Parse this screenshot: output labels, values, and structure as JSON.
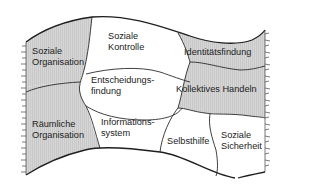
{
  "diagram": {
    "type": "banner-area-diagram",
    "colors": {
      "shaded_fill": "#d2d2d2",
      "white_fill": "#ffffff",
      "stroke": "#2a2a2a",
      "text": "#222222"
    },
    "regions": [
      {
        "id": "soziale-organisation",
        "lines": [
          "Soziale",
          "Organisation"
        ],
        "shaded": true
      },
      {
        "id": "raeumliche-organisation",
        "lines": [
          "Räumliche",
          "Organisation"
        ],
        "shaded": true
      },
      {
        "id": "soziale-kontrolle",
        "lines": [
          "Soziale",
          "Kontrolle"
        ],
        "shaded": false
      },
      {
        "id": "entscheidungsfindung",
        "lines": [
          "Entscheidungs-",
          "findung"
        ],
        "shaded": false
      },
      {
        "id": "informationssystem",
        "lines": [
          "Informations-",
          "system"
        ],
        "shaded": false
      },
      {
        "id": "identitaetsfindung",
        "lines": [
          "Identitätsfindung"
        ],
        "shaded": true
      },
      {
        "id": "kollektives-handeln",
        "lines": [
          "Kollektives Handeln"
        ],
        "shaded": true
      },
      {
        "id": "selbsthilfe",
        "lines": [
          "Selbsthilfe"
        ],
        "shaded": false
      },
      {
        "id": "soziale-sicherheit",
        "lines": [
          "Soziale",
          "Sicherheit"
        ],
        "shaded": false
      }
    ]
  }
}
